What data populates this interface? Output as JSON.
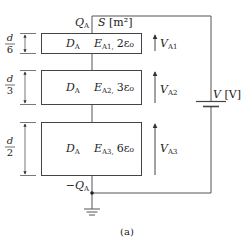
{
  "figure_label": "(a)",
  "top_charge": {
    "symbol": "Q",
    "sub": "A"
  },
  "bottom_charge": {
    "symbol": "−Q",
    "sub": "A"
  },
  "area_label": {
    "symbol": "S",
    "unit": " [m²]"
  },
  "source": {
    "symbol": "V",
    "unit": " [V]"
  },
  "layers": [
    {
      "thickness_num": "d",
      "thickness_den": "6",
      "D": "D",
      "D_sub": "A",
      "E": "E",
      "E_sub": "A1,",
      "perm": "2ε₀",
      "V": "V",
      "V_sub": "A1"
    },
    {
      "thickness_num": "d",
      "thickness_den": "3",
      "D": "D",
      "D_sub": "A",
      "E": "E",
      "E_sub": "A2,",
      "perm": "3ε₀",
      "V": "V",
      "V_sub": "A2"
    },
    {
      "thickness_num": "d",
      "thickness_den": "2",
      "D": "D",
      "D_sub": "A",
      "E": "E",
      "E_sub": "A3,",
      "perm": "6ε₀",
      "V": "V",
      "V_sub": "A3"
    }
  ],
  "colors": {
    "line": "#444444",
    "text": "#222222"
  }
}
